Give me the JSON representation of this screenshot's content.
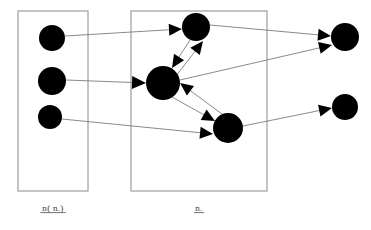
{
  "diagram": {
    "background_color": "#ffffff",
    "node_color": "#000000",
    "box_stroke_color": "#8a8a8a",
    "edge_color": "#7d7d7d",
    "arrow_color": "#000000",
    "width": 371,
    "height": 230
  },
  "groups": [
    {
      "id": "group-left",
      "label": "n( n.)",
      "label_x": 53,
      "label_y": 211,
      "underline": true,
      "box": {
        "x": 18,
        "y": 11,
        "width": 70,
        "height": 180
      }
    },
    {
      "id": "group-middle",
      "label": "n.",
      "label_x": 199,
      "label_y": 211,
      "underline": true,
      "box": {
        "x": 131,
        "y": 11,
        "width": 136,
        "height": 180
      }
    }
  ],
  "nodes": [
    {
      "id": "L1",
      "group": "group-left",
      "cx": 52,
      "cy": 38,
      "r": 13
    },
    {
      "id": "L2",
      "group": "group-left",
      "cx": 52,
      "cy": 81,
      "r": 14
    },
    {
      "id": "L3",
      "group": "group-left",
      "cx": 50,
      "cy": 117,
      "r": 12
    },
    {
      "id": "M1",
      "group": "group-middle",
      "cx": 196,
      "cy": 27,
      "r": 14
    },
    {
      "id": "M2",
      "group": "group-middle",
      "cx": 163,
      "cy": 83,
      "r": 17
    },
    {
      "id": "M3",
      "group": "group-middle",
      "cx": 228,
      "cy": 128,
      "r": 15
    },
    {
      "id": "R1",
      "group": "none",
      "cx": 345,
      "cy": 37,
      "r": 14
    },
    {
      "id": "R2",
      "group": "none",
      "cx": 345,
      "cy": 107,
      "r": 13
    }
  ],
  "edges": [
    {
      "id": "e1",
      "from": "L1",
      "to": "M1",
      "x1": 65,
      "y1": 36,
      "x2": 182,
      "y2": 29,
      "arrow": true,
      "arrow_size": 13
    },
    {
      "id": "e2",
      "from": "L2",
      "to": "M2",
      "x1": 66,
      "y1": 80,
      "x2": 146,
      "y2": 83,
      "arrow": true,
      "arrow_size": 14
    },
    {
      "id": "e3",
      "from": "L3",
      "to": "M3",
      "x1": 62,
      "y1": 119,
      "x2": 213,
      "y2": 134,
      "arrow": true,
      "arrow_size": 13
    },
    {
      "id": "e4",
      "from": "M1",
      "to": "M2",
      "x1": 190,
      "y1": 40,
      "x2": 172,
      "y2": 68,
      "arrow": true,
      "arrow_size": 13
    },
    {
      "id": "e5",
      "from": "M2",
      "to": "M1",
      "x1": 176,
      "y1": 76,
      "x2": 203,
      "y2": 41,
      "arrow": true,
      "arrow_size": 13
    },
    {
      "id": "e6",
      "from": "M3",
      "to": "M2",
      "x1": 222,
      "y1": 114,
      "x2": 180,
      "y2": 83,
      "arrow": true,
      "arrow_size": 13
    },
    {
      "id": "e7",
      "from": "M2",
      "to": "M3",
      "x1": 172,
      "y1": 97,
      "x2": 215,
      "y2": 121,
      "arrow": true,
      "arrow_size": 13
    },
    {
      "id": "e8",
      "from": "M1",
      "to": "R1",
      "x1": 210,
      "y1": 25,
      "x2": 331,
      "y2": 36,
      "arrow": true,
      "arrow_size": 13
    },
    {
      "id": "e9",
      "from": "M2",
      "to": "R1",
      "x1": 180,
      "y1": 80,
      "x2": 332,
      "y2": 45,
      "arrow": true,
      "arrow_size": 13
    },
    {
      "id": "e10",
      "from": "M3",
      "to": "R2",
      "x1": 243,
      "y1": 126,
      "x2": 332,
      "y2": 108,
      "arrow": true,
      "arrow_size": 13
    }
  ]
}
